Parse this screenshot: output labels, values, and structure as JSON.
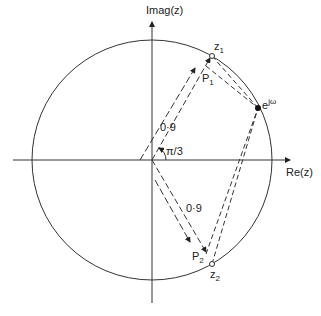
{
  "diagram": {
    "axes": {
      "x_label": "Re(z)",
      "y_label": "Imag(z)"
    },
    "unit_circle": {
      "center": [
        152,
        160
      ],
      "radius": 120
    },
    "points": {
      "z1": {
        "label": "z",
        "sub": "1",
        "pos": [
          212,
          56
        ]
      },
      "p1": {
        "label": "P",
        "sub": "1",
        "pos": [
          206,
          66
        ]
      },
      "z2": {
        "label": "z",
        "sub": "2",
        "pos": [
          212,
          264
        ]
      },
      "p2": {
        "label": "P",
        "sub": "2",
        "pos": [
          206,
          254
        ]
      },
      "ejw": {
        "label": "e",
        "sup": "jω",
        "pos": [
          258,
          108
        ]
      }
    },
    "annotations": {
      "radius_upper": "0·9",
      "radius_lower": "0·9",
      "angle": "π/3"
    }
  }
}
